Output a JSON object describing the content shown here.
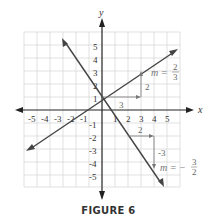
{
  "figure": {
    "caption": "FIGURE 6",
    "x_axis_label": "x",
    "y_axis_label": "y",
    "x_ticks": [
      "-5",
      "-4",
      "-3",
      "-2",
      "-1",
      "1",
      "2",
      "3",
      "4",
      "5"
    ],
    "y_ticks": [
      "5",
      "4",
      "3",
      "2",
      "1",
      "-1",
      "-2",
      "-3",
      "-4",
      "-5"
    ],
    "lines": [
      {
        "name": "line-positive-slope",
        "equation": "y = (2/3)x + 1",
        "slope_label": "m = 2/3",
        "run_label": "3",
        "rise_label": "2"
      },
      {
        "name": "line-negative-slope",
        "equation": "y = (-3/2)x + 1",
        "slope_label": "m = -3/2",
        "run_label": "2",
        "rise_label": "-3"
      }
    ],
    "colors": {
      "axes": "#222222",
      "lines": "#444444",
      "grid": "#cccccc",
      "annotation": "#777777"
    }
  }
}
